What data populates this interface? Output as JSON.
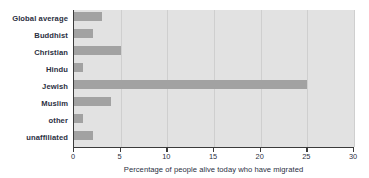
{
  "chart_data": {
    "type": "bar",
    "orientation": "horizontal",
    "title": "",
    "subtitle": "",
    "xlabel": "Percentage of people alive today who have migrated",
    "ylabel": "",
    "xlim": [
      0,
      30
    ],
    "xticks": [
      0,
      5,
      10,
      15,
      20,
      25,
      30
    ],
    "xtick_labels": [
      "0",
      "5",
      "10",
      "15",
      "20",
      "25",
      "30"
    ],
    "grid": true,
    "grid_axis": "x",
    "legend": false,
    "legend_position": "none",
    "categories": [
      "Global average",
      "Buddhist",
      "Christian",
      "Hindu",
      "Jewish",
      "Muslim",
      "other",
      "unaffiliated"
    ],
    "values": [
      3,
      2,
      5,
      1,
      25,
      4,
      1,
      2
    ],
    "series": [
      {
        "name": "Percentage of people alive today who have migrated",
        "values": [
          3,
          2,
          5,
          1,
          25,
          4,
          1,
          2
        ]
      }
    ],
    "colors": {
      "bar": "#a2a2a2",
      "plot_background": "#e2e2e2",
      "gridline": "#cfcfcf",
      "axis_line": "#3b3b3b",
      "label_text": "#2b2f42",
      "figure_background": "#ffffff"
    }
  }
}
